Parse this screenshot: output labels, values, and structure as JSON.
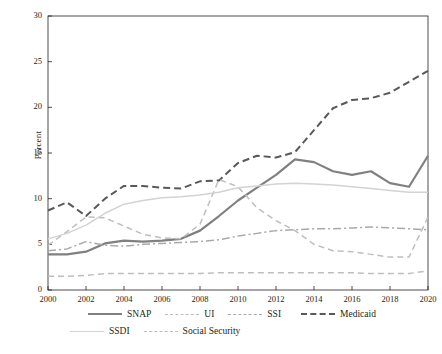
{
  "chart_data": {
    "type": "line",
    "title": "",
    "xlabel": "",
    "ylabel": "Percent",
    "xlim": [
      2000,
      2020
    ],
    "ylim": [
      0,
      30
    ],
    "ytick_labels": [
      "0",
      "5",
      "10",
      "15",
      "20",
      "25",
      "30"
    ],
    "yticks": [
      0,
      5,
      10,
      15,
      20,
      25,
      30
    ],
    "xtick_labels": [
      "2000",
      "2002",
      "2004",
      "2006",
      "2008",
      "2010",
      "2012",
      "2014",
      "2016",
      "2018",
      "2020"
    ],
    "xticks": [
      2000,
      2002,
      2004,
      2006,
      2008,
      2010,
      2012,
      2014,
      2016,
      2018,
      2020
    ],
    "grid": false,
    "legend_position": "bottom",
    "x": [
      2000,
      2001,
      2002,
      2003,
      2004,
      2005,
      2006,
      2007,
      2008,
      2009,
      2010,
      2011,
      2012,
      2013,
      2014,
      2015,
      2016,
      2017,
      2018,
      2019,
      2020
    ],
    "series": [
      {
        "name": "SNAP",
        "color": "#808080",
        "style": "solid",
        "width": 2.2,
        "values": [
          3.9,
          3.9,
          4.2,
          5.1,
          5.4,
          5.3,
          5.4,
          5.6,
          6.5,
          8.1,
          9.8,
          11.2,
          12.6,
          14.3,
          14.0,
          13.0,
          12.6,
          13.0,
          11.7,
          11.3,
          14.7
        ]
      },
      {
        "name": "Medicaid",
        "color": "#58595b",
        "style": "dashed",
        "width": 2.0,
        "values": [
          8.7,
          9.6,
          8.1,
          10.0,
          11.4,
          11.4,
          11.2,
          11.1,
          11.9,
          12.0,
          13.9,
          14.7,
          14.5,
          15.1,
          17.5,
          19.9,
          20.8,
          21.0,
          21.6,
          22.8,
          24.0
        ]
      },
      {
        "name": "UI",
        "color": "#bcbec0",
        "style": "dashed",
        "width": 1.5,
        "values": [
          4.9,
          6.4,
          8.0,
          7.9,
          7.0,
          6.1,
          5.7,
          5.6,
          7.2,
          12.1,
          11.3,
          9.0,
          7.6,
          6.5,
          5.0,
          4.3,
          4.2,
          3.9,
          3.6,
          3.6,
          8.0
        ]
      },
      {
        "name": "SSDI",
        "color": "#d1d3d4",
        "style": "solid",
        "width": 1.5,
        "values": [
          5.6,
          6.2,
          7.1,
          8.4,
          9.4,
          9.8,
          10.1,
          10.2,
          10.4,
          10.7,
          11.2,
          11.4,
          11.6,
          11.7,
          11.6,
          11.5,
          11.3,
          11.1,
          10.9,
          10.7,
          10.7
        ]
      },
      {
        "name": "SSI",
        "color": "#a7a9ac",
        "style": "dashdot",
        "width": 1.5,
        "values": [
          4.3,
          4.5,
          5.3,
          4.9,
          4.8,
          5.0,
          5.1,
          5.2,
          5.3,
          5.5,
          5.9,
          6.2,
          6.5,
          6.6,
          6.7,
          6.7,
          6.8,
          6.9,
          6.8,
          6.7,
          6.6
        ]
      },
      {
        "name": "Social Security",
        "color": "#bcbec0",
        "style": "dashed",
        "width": 1.5,
        "values": [
          1.5,
          1.5,
          1.6,
          1.8,
          1.8,
          1.8,
          1.8,
          1.8,
          1.8,
          1.9,
          1.9,
          1.9,
          1.9,
          1.9,
          1.9,
          1.9,
          1.9,
          1.8,
          1.8,
          1.8,
          2.1
        ]
      }
    ]
  },
  "legend": [
    {
      "label": "SNAP"
    },
    {
      "label": "UI"
    },
    {
      "label": "SSI"
    },
    {
      "label": "Medicaid"
    },
    {
      "label": "SSDI"
    },
    {
      "label": "Social Security"
    }
  ],
  "axis": {
    "ylabel": "Percent"
  }
}
